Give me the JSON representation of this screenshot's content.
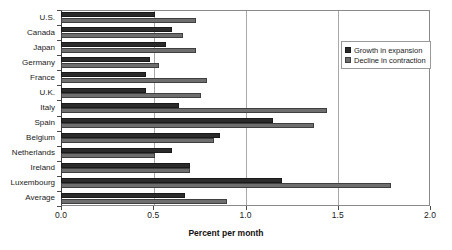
{
  "chart_data": {
    "type": "bar",
    "orientation": "horizontal",
    "title": "",
    "xlabel": "Percent per month",
    "ylabel": "",
    "xlim": [
      0.0,
      2.0
    ],
    "xticks": [
      "0.0",
      "0.5",
      "1.0",
      "1.5",
      "2.0"
    ],
    "xtick_values": [
      0.0,
      0.5,
      1.0,
      1.5,
      2.0
    ],
    "grid": true,
    "grid_axis": "x",
    "legend_position": "top-right",
    "categories": [
      "U.S.",
      "Canada",
      "Japan",
      "Germany",
      "France",
      "U.K.",
      "Italy",
      "Spain",
      "Belgium",
      "Netherlands",
      "Ireland",
      "Luxembourg",
      "Average"
    ],
    "series": [
      {
        "name": "Growth in expansion",
        "color": "#2b2b2b",
        "values": [
          0.51,
          0.6,
          0.57,
          0.48,
          0.46,
          0.46,
          0.64,
          1.15,
          0.86,
          0.6,
          0.7,
          1.2,
          0.67
        ]
      },
      {
        "name": "Decline in contraction",
        "color": "#6e6e6e",
        "values": [
          0.73,
          0.66,
          0.73,
          0.53,
          0.79,
          0.76,
          1.44,
          1.37,
          0.83,
          0.51,
          0.7,
          1.79,
          0.9
        ]
      }
    ]
  },
  "legend": {
    "items": [
      {
        "label": "Growth in expansion"
      },
      {
        "label": "Decline in contraction"
      }
    ]
  }
}
